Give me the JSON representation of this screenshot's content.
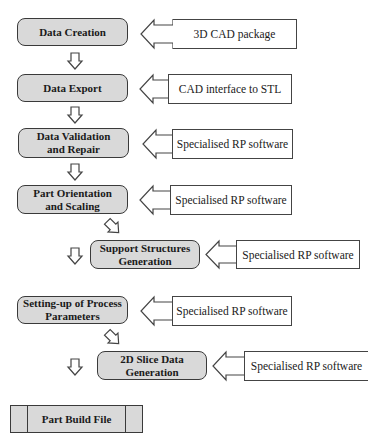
{
  "diagram": {
    "steps": [
      {
        "label": "Data Creation",
        "source": "3D CAD package"
      },
      {
        "label": "Data Export",
        "source": "CAD interface to STL"
      },
      {
        "label": "Data Validation\nand Repair",
        "source": "Specialised RP software"
      },
      {
        "label": "Part Orientation\nand Scaling",
        "source": "Specialised RP software"
      },
      {
        "label": "Support Structures\nGeneration",
        "source": "Specialised RP software"
      },
      {
        "label": "Setting-up of Process\nParameters",
        "source": "Specialised RP software"
      },
      {
        "label": "2D Slice Data\nGeneration",
        "source": "Specialised RP software"
      }
    ],
    "output": {
      "label": "Part Build File"
    },
    "colors": {
      "step_fill": "#d9d9d9",
      "stroke": "#3a3a3a",
      "source_fill": "#ffffff"
    }
  }
}
